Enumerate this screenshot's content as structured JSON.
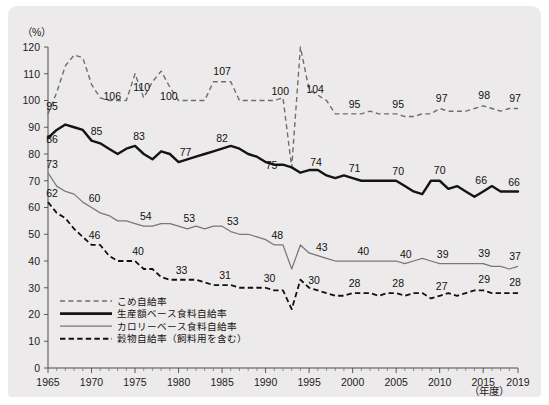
{
  "figure": {
    "unit_label": "（%）",
    "x_unit_label": "（年度）"
  },
  "legend": {
    "items": [
      {
        "label": "こめ自給率",
        "style": "dashed-gray",
        "color": "#6e6e6e"
      },
      {
        "label": "生産額ベース食料自給率",
        "style": "solid-thick-black",
        "color": "#141414"
      },
      {
        "label": "カロリーベース食料自給率",
        "style": "solid-thin-gray",
        "color": "#777777"
      },
      {
        "label": "穀物自給率（飼料用を含む）",
        "style": "dashed-black",
        "color": "#111111"
      }
    ]
  },
  "chart_data": {
    "type": "line",
    "title": "",
    "xlabel": "（年度）",
    "ylabel": "（%）",
    "xlim": [
      1965,
      2019
    ],
    "ylim": [
      0,
      120
    ],
    "yticks": [
      0,
      10,
      20,
      30,
      40,
      50,
      60,
      70,
      80,
      90,
      100,
      110,
      120
    ],
    "xticks": [
      1965,
      1970,
      1975,
      1980,
      1985,
      1990,
      1995,
      2000,
      2005,
      2010,
      2015,
      2019
    ],
    "xtick_labels": [
      "1965",
      "1970",
      "1975",
      "1980",
      "1985",
      "1990",
      "1995",
      "2000",
      "2005",
      "2010",
      "2015",
      "2019"
    ],
    "grid": false,
    "legend_position": "lower-left",
    "x": [
      1965,
      1966,
      1967,
      1968,
      1969,
      1970,
      1971,
      1972,
      1973,
      1974,
      1975,
      1976,
      1977,
      1978,
      1979,
      1980,
      1981,
      1982,
      1983,
      1984,
      1985,
      1986,
      1987,
      1988,
      1989,
      1990,
      1991,
      1992,
      1993,
      1994,
      1995,
      1996,
      1997,
      1998,
      1999,
      2000,
      2001,
      2002,
      2003,
      2004,
      2005,
      2006,
      2007,
      2008,
      2009,
      2010,
      2011,
      2012,
      2013,
      2014,
      2015,
      2016,
      2017,
      2018,
      2019
    ],
    "series": [
      {
        "name": "こめ自給率",
        "key": "rice",
        "color": "#6e6e6e",
        "dash": "5 3.4",
        "width": 1.4,
        "values": [
          95,
          103,
          113,
          117,
          116,
          106,
          101,
          100,
          100,
          100,
          110,
          101,
          107,
          111,
          105,
          100,
          100,
          100,
          100,
          107,
          107,
          107,
          100,
          100,
          100,
          100,
          100,
          101,
          75,
          120,
          104,
          102,
          100,
          95,
          95,
          95,
          95,
          96,
          95,
          95,
          95,
          94,
          94,
          95,
          95,
          97,
          96,
          96,
          96,
          97,
          98,
          97,
          96,
          97,
          97
        ]
      },
      {
        "name": "生産額ベース食料自給率",
        "key": "production",
        "color": "#141414",
        "dash": "",
        "width": 2.4,
        "values": [
          86,
          89,
          91,
          90,
          89,
          85,
          84,
          82,
          80,
          82,
          83,
          80,
          78,
          81,
          80,
          77,
          78,
          79,
          80,
          81,
          82,
          83,
          82,
          80,
          79,
          77,
          76,
          76,
          75,
          73,
          74,
          74,
          72,
          71,
          72,
          71,
          70,
          70,
          70,
          70,
          70,
          68,
          66,
          65,
          70,
          70,
          67,
          68,
          66,
          64,
          66,
          68,
          66,
          66,
          66
        ]
      },
      {
        "name": "カロリーベース食料自給率",
        "key": "calorie",
        "color": "#777777",
        "dash": "",
        "width": 1.25,
        "values": [
          73,
          68,
          66,
          65,
          62,
          60,
          58,
          57,
          55,
          55,
          54,
          53,
          53,
          54,
          54,
          53,
          52,
          53,
          52,
          53,
          53,
          51,
          50,
          50,
          49,
          48,
          46,
          46,
          37,
          46,
          43,
          42,
          41,
          40,
          40,
          40,
          40,
          40,
          40,
          40,
          40,
          39,
          40,
          41,
          40,
          39,
          39,
          39,
          39,
          39,
          39,
          38,
          38,
          37,
          38
        ]
      },
      {
        "name": "穀物自給率（飼料用を含む）",
        "key": "grain",
        "color": "#111111",
        "dash": "5.4 3.2",
        "width": 1.8,
        "values": [
          62,
          58,
          56,
          52,
          49,
          46,
          46,
          42,
          40,
          40,
          40,
          37,
          37,
          34,
          33,
          33,
          33,
          33,
          32,
          31,
          31,
          31,
          30,
          30,
          30,
          30,
          29,
          29,
          22,
          33,
          30,
          29,
          28,
          27,
          27,
          28,
          28,
          28,
          27,
          28,
          28,
          27,
          28,
          28,
          26,
          27,
          28,
          27,
          28,
          29,
          29,
          28,
          28,
          28,
          28
        ]
      }
    ],
    "point_labels": [
      {
        "series": "rice",
        "x": 1965,
        "value": 95,
        "text": "95",
        "dx": 4,
        "dy": -4
      },
      {
        "series": "rice",
        "x": 1971,
        "value": 106,
        "text": "106",
        "dx": 12,
        "dy": 2
      },
      {
        "series": "rice",
        "x": 1976,
        "value": 110,
        "text": "110",
        "dx": -2,
        "dy": -7
      },
      {
        "series": "rice",
        "x": 1979,
        "value": 100,
        "text": "100",
        "dx": -1,
        "dy": 13
      },
      {
        "series": "rice",
        "x": 1985,
        "value": 107,
        "text": "107",
        "dx": 0,
        "dy": -7
      },
      {
        "series": "rice",
        "x": 1991,
        "value": 100,
        "text": "100",
        "dx": 6,
        "dy": -6
      },
      {
        "series": "rice",
        "x": 1995,
        "value": 104,
        "text": "104",
        "dx": 6,
        "dy": 3
      },
      {
        "series": "rice",
        "x": 2000,
        "value": 95,
        "text": "95",
        "dx": 2,
        "dy": -6
      },
      {
        "series": "rice",
        "x": 2005,
        "value": 95,
        "text": "95",
        "dx": 2,
        "dy": -6
      },
      {
        "series": "rice",
        "x": 2010,
        "value": 97,
        "text": "97",
        "dx": 2,
        "dy": -7
      },
      {
        "series": "rice",
        "x": 2015,
        "value": 98,
        "text": "98",
        "dx": 1,
        "dy": -7
      },
      {
        "series": "rice",
        "x": 2019,
        "value": 97,
        "text": "97",
        "dx": -3,
        "dy": -7
      },
      {
        "series": "production",
        "x": 1965,
        "value": 86,
        "text": "86",
        "dx": 4,
        "dy": 5
      },
      {
        "series": "production",
        "x": 1970,
        "value": 85,
        "text": "85",
        "dx": 5,
        "dy": -6
      },
      {
        "series": "production",
        "x": 1975,
        "value": 83,
        "text": "83",
        "dx": 4,
        "dy": -6
      },
      {
        "series": "production",
        "x": 1980,
        "value": 77,
        "text": "77",
        "dx": 7,
        "dy": -6
      },
      {
        "series": "production",
        "x": 1985,
        "value": 82,
        "text": "82",
        "dx": 0,
        "dy": -7
      },
      {
        "series": "production",
        "x": 1990,
        "value": 77,
        "text": "75",
        "dx": 6,
        "dy": 7
      },
      {
        "series": "production",
        "x": 1995,
        "value": 74,
        "text": "74",
        "dx": 7,
        "dy": -4
      },
      {
        "series": "production",
        "x": 2000,
        "value": 70,
        "text": "71",
        "dx": 2,
        "dy": -6
      },
      {
        "series": "production",
        "x": 2005,
        "value": 70,
        "text": "70",
        "dx": 2,
        "dy": -6
      },
      {
        "series": "production",
        "x": 2010,
        "value": 70,
        "text": "70",
        "dx": 0,
        "dy": -7
      },
      {
        "series": "production",
        "x": 2015,
        "value": 66,
        "text": "66",
        "dx": -2,
        "dy": -7
      },
      {
        "series": "production",
        "x": 2019,
        "value": 66,
        "text": "66",
        "dx": -4,
        "dy": -5
      },
      {
        "series": "calorie",
        "x": 1965,
        "value": 73,
        "text": "73",
        "dx": 4,
        "dy": -5
      },
      {
        "series": "calorie",
        "x": 1970,
        "value": 60,
        "text": "60",
        "dx": 3,
        "dy": -6
      },
      {
        "series": "calorie",
        "x": 1976,
        "value": 54,
        "text": "54",
        "dx": 2,
        "dy": -6
      },
      {
        "series": "calorie",
        "x": 1981,
        "value": 53,
        "text": "53",
        "dx": 2,
        "dy": -7
      },
      {
        "series": "calorie",
        "x": 1986,
        "value": 53,
        "text": "53",
        "dx": 2,
        "dy": -7
      },
      {
        "series": "calorie",
        "x": 1991,
        "value": 48,
        "text": "48",
        "dx": 3,
        "dy": -6
      },
      {
        "series": "calorie",
        "x": 1996,
        "value": 43,
        "text": "43",
        "dx": 4,
        "dy": -5
      },
      {
        "series": "calorie",
        "x": 2001,
        "value": 40,
        "text": "40",
        "dx": 2,
        "dy": -6
      },
      {
        "series": "calorie",
        "x": 2006,
        "value": 40,
        "text": "40",
        "dx": 1,
        "dy": -6
      },
      {
        "series": "calorie",
        "x": 2010,
        "value": 39,
        "text": "39",
        "dx": 3,
        "dy": -6
      },
      {
        "series": "calorie",
        "x": 2015,
        "value": 39,
        "text": "39",
        "dx": 1,
        "dy": -7
      },
      {
        "series": "calorie",
        "x": 2019,
        "value": 37,
        "text": "37",
        "dx": -3,
        "dy": -6
      },
      {
        "series": "grain",
        "x": 1965,
        "value": 62,
        "text": "62",
        "dx": 4,
        "dy": -5
      },
      {
        "series": "grain",
        "x": 1970,
        "value": 46,
        "text": "46",
        "dx": 3,
        "dy": -6
      },
      {
        "series": "grain",
        "x": 1975,
        "value": 40,
        "text": "40",
        "dx": 3,
        "dy": -6
      },
      {
        "series": "grain",
        "x": 1980,
        "value": 33,
        "text": "33",
        "dx": 3,
        "dy": -6
      },
      {
        "series": "grain",
        "x": 1985,
        "value": 31,
        "text": "31",
        "dx": 3,
        "dy": -6
      },
      {
        "series": "grain",
        "x": 1990,
        "value": 30,
        "text": "30",
        "dx": 4,
        "dy": -6
      },
      {
        "series": "grain",
        "x": 1995,
        "value": 30,
        "text": "30",
        "dx": 5,
        "dy": -4
      },
      {
        "series": "grain",
        "x": 2000,
        "value": 28,
        "text": "28",
        "dx": 2,
        "dy": -6
      },
      {
        "series": "grain",
        "x": 2005,
        "value": 28,
        "text": "28",
        "dx": 2,
        "dy": -6
      },
      {
        "series": "grain",
        "x": 2010,
        "value": 27,
        "text": "27",
        "dx": 2,
        "dy": -6
      },
      {
        "series": "grain",
        "x": 2015,
        "value": 29,
        "text": "29",
        "dx": 1,
        "dy": -7
      },
      {
        "series": "grain",
        "x": 2019,
        "value": 28,
        "text": "28",
        "dx": -3,
        "dy": -7
      }
    ]
  }
}
